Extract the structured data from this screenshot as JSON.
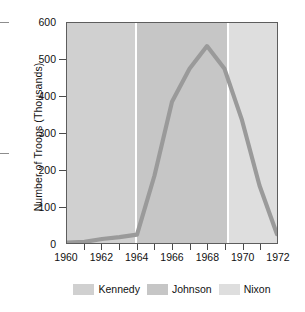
{
  "chart_data": {
    "type": "line",
    "title": "",
    "xlabel": "",
    "ylabel": "Number of Troops (Thousands)",
    "xlim": [
      1960,
      1972
    ],
    "ylim": [
      0,
      600
    ],
    "grid": false,
    "legend_position": "bottom",
    "x": [
      1960,
      1961,
      1962,
      1963,
      1964,
      1965,
      1966,
      1967,
      1968,
      1969,
      1970,
      1971,
      1972
    ],
    "values": [
      1,
      3,
      11,
      16,
      23,
      184,
      385,
      475,
      537,
      475,
      335,
      157,
      24
    ],
    "series": [
      {
        "name": "U.S. Troops in Vietnam",
        "values": [
          1,
          3,
          11,
          16,
          23,
          184,
          385,
          475,
          537,
          475,
          335,
          157,
          24
        ],
        "color": "#9a9a9a"
      }
    ],
    "x_tick_labels": [
      "1960",
      "1962",
      "1964",
      "1966",
      "1968",
      "1970",
      "1972"
    ],
    "x_tick_values": [
      1960,
      1962,
      1964,
      1966,
      1968,
      1970,
      1972
    ],
    "x_minor_tick_values": [
      1961,
      1963,
      1965,
      1967,
      1969,
      1971
    ],
    "y_tick_labels": [
      "0",
      "100",
      "200",
      "300",
      "400",
      "500",
      "600"
    ],
    "y_tick_values": [
      0,
      100,
      200,
      300,
      400,
      500,
      600
    ],
    "peak_value": 537,
    "peak_year": 1968,
    "bands": [
      {
        "name": "Kennedy",
        "start": 1960,
        "end": 1963.9,
        "color": "#d0d0d0"
      },
      {
        "name": "Johnson",
        "start": 1963.9,
        "end": 1969.1,
        "color": "#c6c6c6"
      },
      {
        "name": "Nixon",
        "start": 1969.1,
        "end": 1972,
        "color": "#dedede"
      }
    ],
    "legend": [
      {
        "label": "Kennedy",
        "color": "#d0d0d0"
      },
      {
        "label": "Johnson",
        "color": "#c6c6c6"
      },
      {
        "label": "Nixon",
        "color": "#dedede"
      }
    ]
  }
}
